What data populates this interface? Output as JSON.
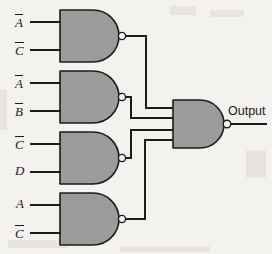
{
  "diagram": {
    "background_color": "#f4f2ee",
    "gate_fill": "#9b9b9b",
    "line_color": "#1c1c1c",
    "output_label": "Output",
    "gates": [
      {
        "id": "gate-1",
        "type": "NAND",
        "inputs": [
          {
            "label": "A",
            "overline": true
          },
          {
            "label": "C",
            "overline": true
          }
        ]
      },
      {
        "id": "gate-2",
        "type": "NAND",
        "inputs": [
          {
            "label": "A",
            "overline": true
          },
          {
            "label": "B",
            "overline": true
          }
        ]
      },
      {
        "id": "gate-3",
        "type": "NAND",
        "inputs": [
          {
            "label": "C",
            "overline": true
          },
          {
            "label": "D",
            "overline": false
          }
        ]
      },
      {
        "id": "gate-4",
        "type": "NAND",
        "inputs": [
          {
            "label": "A",
            "overline": false
          },
          {
            "label": "C",
            "overline": true
          }
        ]
      },
      {
        "id": "gate-output",
        "type": "NAND",
        "input_count": 4
      }
    ],
    "labels": {
      "g1_in1": "A",
      "g1_in2": "C",
      "g2_in1": "A",
      "g2_in2": "B",
      "g3_in1": "C",
      "g3_in2": "D",
      "g4_in1": "A",
      "g4_in2": "C"
    }
  }
}
